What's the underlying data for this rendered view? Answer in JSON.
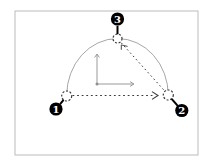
{
  "figure": {
    "nodes": [
      {
        "id": "waypoint-1",
        "label": "1"
      },
      {
        "id": "waypoint-2",
        "label": "2"
      },
      {
        "id": "waypoint-3",
        "label": "3"
      }
    ],
    "colors": {
      "background": "#ffffff",
      "border": "#bcbcbc",
      "guide": "#8f8f8f",
      "line": "#3a3a3a",
      "node_fill": "#000000",
      "node_text": "#ffffff"
    }
  }
}
